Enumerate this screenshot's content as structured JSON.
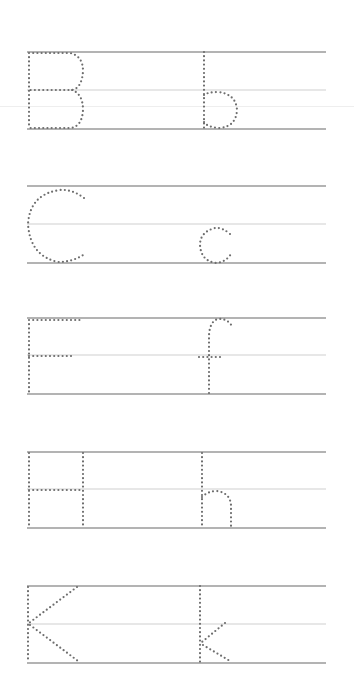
{
  "worksheet": {
    "title": "Letter tracing worksheet",
    "line_colors": {
      "baseline": "#9a9a9a",
      "midline": "#cfcfcf",
      "dot": "#6e6e6e"
    },
    "line_x_start": 27,
    "line_x_end": 326,
    "rows": [
      {
        "uppercase": "B",
        "lowercase": "b",
        "top_y": 52,
        "mid_y": 90,
        "bottom_y": 129
      },
      {
        "uppercase": "C",
        "lowercase": "c",
        "top_y": 186,
        "mid_y": 224,
        "bottom_y": 263
      },
      {
        "uppercase": "F",
        "lowercase": "f",
        "top_y": 318,
        "mid_y": 355,
        "bottom_y": 394
      },
      {
        "uppercase": "H",
        "lowercase": "h",
        "top_y": 452,
        "mid_y": 489,
        "bottom_y": 528
      },
      {
        "uppercase": "K",
        "lowercase": "k",
        "top_y": 586,
        "mid_y": 624,
        "bottom_y": 663
      }
    ]
  }
}
